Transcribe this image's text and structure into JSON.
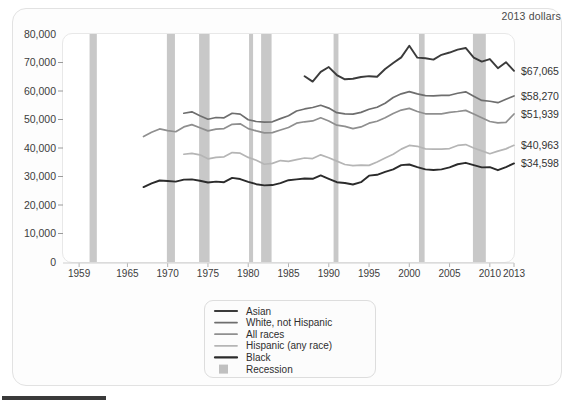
{
  "units_note": "2013 dollars",
  "chart_data": {
    "type": "line",
    "title": "",
    "subtitle": "",
    "xlabel": "",
    "ylabel": "",
    "units": "2013 dollars",
    "xlim": [
      1957,
      2013
    ],
    "ylim": [
      0,
      80000
    ],
    "grid": false,
    "legend_position": "bottom-center",
    "xticks": [
      "1959",
      "1965",
      "1970",
      "1975",
      "1980",
      "1985",
      "1990",
      "1995",
      "2000",
      "2005",
      "2010",
      "2013"
    ],
    "xtick_values": [
      1959,
      1965,
      1970,
      1975,
      1980,
      1985,
      1990,
      1995,
      2000,
      2005,
      2010,
      2013
    ],
    "yticks": [
      "0",
      "10,000",
      "20,000",
      "30,000",
      "40,000",
      "50,000",
      "60,000",
      "70,000",
      "80,000"
    ],
    "ytick_values": [
      0,
      10000,
      20000,
      30000,
      40000,
      50000,
      60000,
      70000,
      80000
    ],
    "end_labels": [
      {
        "series": "Asian",
        "text": "$67,065",
        "value": 67065
      },
      {
        "series": "White, not Hispanic",
        "text": "$58,270",
        "value": 58270
      },
      {
        "series": "All races",
        "text": "$51,939",
        "value": 51939
      },
      {
        "series": "Hispanic (any race)",
        "text": "$40,963",
        "value": 40963
      },
      {
        "series": "Black",
        "text": "$34,598",
        "value": 34598
      }
    ],
    "legend": [
      {
        "label": "Asian",
        "color": "#3b3b3b",
        "type": "line"
      },
      {
        "label": "White, not Hispanic",
        "color": "#6e6e6e",
        "type": "line"
      },
      {
        "label": "All races",
        "color": "#8f8f8f",
        "type": "line"
      },
      {
        "label": "Hispanic (any race)",
        "color": "#b5b5b5",
        "type": "line"
      },
      {
        "label": "Black",
        "color": "#2b2b2b",
        "type": "line"
      },
      {
        "label": "Recession",
        "color": "#b0b0b0",
        "type": "band"
      }
    ],
    "recessions": [
      {
        "start": 1960.3,
        "end": 1961.2
      },
      {
        "start": 1969.9,
        "end": 1970.9
      },
      {
        "start": 1973.9,
        "end": 1975.2
      },
      {
        "start": 1980.1,
        "end": 1980.6
      },
      {
        "start": 1981.6,
        "end": 1982.9
      },
      {
        "start": 1990.6,
        "end": 1991.2
      },
      {
        "start": 2001.2,
        "end": 2001.9
      },
      {
        "start": 2007.9,
        "end": 2009.5
      }
    ],
    "series": [
      {
        "name": "Asian",
        "color": "#3b3b3b",
        "width": 1.9,
        "x": [
          1987,
          1988,
          1989,
          1990,
          1991,
          1992,
          1993,
          1994,
          1995,
          1996,
          1997,
          1998,
          1999,
          2000,
          2001,
          2002,
          2003,
          2004,
          2005,
          2006,
          2007,
          2008,
          2009,
          2010,
          2011,
          2012,
          2013
        ],
        "values": [
          65200,
          63300,
          66700,
          68400,
          65600,
          64100,
          64300,
          64900,
          65200,
          65000,
          67700,
          69800,
          71800,
          75900,
          71700,
          71500,
          71000,
          72700,
          73500,
          74500,
          75100,
          71700,
          70300,
          71200,
          68000,
          70100,
          67065
        ]
      },
      {
        "name": "White, not Hispanic",
        "color": "#6e6e6e",
        "width": 1.7,
        "x": [
          1972,
          1973,
          1974,
          1975,
          1976,
          1977,
          1978,
          1979,
          1980,
          1981,
          1982,
          1983,
          1984,
          1985,
          1986,
          1987,
          1988,
          1989,
          1990,
          1991,
          1992,
          1993,
          1994,
          1995,
          1996,
          1997,
          1998,
          1999,
          2000,
          2001,
          2002,
          2003,
          2004,
          2005,
          2006,
          2007,
          2008,
          2009,
          2010,
          2011,
          2012,
          2013
        ],
        "values": [
          52200,
          52700,
          51300,
          50100,
          50700,
          50600,
          52200,
          51900,
          49900,
          49300,
          49100,
          49200,
          50300,
          51300,
          53000,
          53700,
          54200,
          55000,
          54000,
          52400,
          52000,
          51900,
          52500,
          53600,
          54300,
          55700,
          57700,
          59000,
          59800,
          59000,
          58400,
          58300,
          58500,
          58500,
          59200,
          59700,
          58200,
          56700,
          56400,
          55900,
          57100,
          58270
        ]
      },
      {
        "name": "All races",
        "color": "#8f8f8f",
        "width": 1.7,
        "x": [
          1967,
          1968,
          1969,
          1970,
          1971,
          1972,
          1973,
          1974,
          1975,
          1976,
          1977,
          1978,
          1979,
          1980,
          1981,
          1982,
          1983,
          1984,
          1985,
          1986,
          1987,
          1988,
          1989,
          1990,
          1991,
          1992,
          1993,
          1994,
          1995,
          1996,
          1997,
          1998,
          1999,
          2000,
          2001,
          2002,
          2003,
          2004,
          2005,
          2006,
          2007,
          2008,
          2009,
          2010,
          2011,
          2012,
          2013
        ],
        "values": [
          44000,
          45500,
          46700,
          46100,
          45700,
          47400,
          48200,
          47100,
          46000,
          46600,
          46800,
          48300,
          48500,
          46800,
          46000,
          45300,
          45400,
          46300,
          47200,
          48700,
          49200,
          49500,
          50600,
          49500,
          48000,
          47600,
          46800,
          47400,
          48700,
          49400,
          50600,
          52100,
          53300,
          53900,
          52800,
          52000,
          52000,
          52000,
          52500,
          52800,
          53200,
          51900,
          50600,
          49300,
          48800,
          49000,
          51939
        ]
      },
      {
        "name": "Hispanic (any race)",
        "color": "#b5b5b5",
        "width": 1.7,
        "x": [
          1972,
          1973,
          1974,
          1975,
          1976,
          1977,
          1978,
          1979,
          1980,
          1981,
          1982,
          1983,
          1984,
          1985,
          1986,
          1987,
          1988,
          1989,
          1990,
          1991,
          1992,
          1993,
          1994,
          1995,
          1996,
          1997,
          1998,
          1999,
          2000,
          2001,
          2002,
          2003,
          2004,
          2005,
          2006,
          2007,
          2008,
          2009,
          2010,
          2011,
          2012,
          2013
        ],
        "values": [
          37800,
          38100,
          37600,
          36200,
          36700,
          36900,
          38400,
          38200,
          36700,
          35700,
          34300,
          34600,
          35600,
          35300,
          35900,
          36500,
          36300,
          37600,
          36600,
          35400,
          34200,
          33800,
          34000,
          33900,
          35100,
          36500,
          37800,
          39600,
          40900,
          40600,
          39700,
          39600,
          39600,
          39800,
          40900,
          41200,
          40000,
          39000,
          38000,
          38900,
          39700,
          40963
        ]
      },
      {
        "name": "Black",
        "color": "#2b2b2b",
        "width": 1.9,
        "x": [
          1967,
          1968,
          1969,
          1970,
          1971,
          1972,
          1973,
          1974,
          1975,
          1976,
          1977,
          1978,
          1979,
          1980,
          1981,
          1982,
          1983,
          1984,
          1985,
          1986,
          1987,
          1988,
          1989,
          1990,
          1991,
          1992,
          1993,
          1994,
          1995,
          1996,
          1997,
          1998,
          1999,
          2000,
          2001,
          2002,
          2003,
          2004,
          2005,
          2006,
          2007,
          2008,
          2009,
          2010,
          2011,
          2012,
          2013
        ],
        "values": [
          26300,
          27600,
          28600,
          28400,
          28200,
          28900,
          29000,
          28500,
          27900,
          28200,
          28000,
          29500,
          29100,
          28100,
          27300,
          26900,
          27000,
          27700,
          28700,
          29000,
          29300,
          29200,
          30400,
          29200,
          28000,
          27700,
          27200,
          28000,
          30300,
          30600,
          31600,
          32500,
          34000,
          34200,
          33300,
          32500,
          32300,
          32500,
          33200,
          34300,
          34800,
          34000,
          33200,
          33300,
          32200,
          33300,
          34598
        ]
      }
    ]
  },
  "bottom_bar": {
    "present": true
  }
}
